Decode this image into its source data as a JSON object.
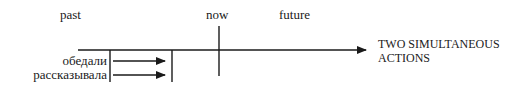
{
  "diagram": {
    "type": "timeline",
    "labels": {
      "past": "past",
      "now": "now",
      "future": "future"
    },
    "actions": [
      {
        "verb": "обедали"
      },
      {
        "verb": "рассказывала"
      }
    ],
    "caption_line1": "TWO SIMULTANEOUS",
    "caption_line2": "ACTIONS",
    "colors": {
      "line": "#1a1a1a",
      "background": "#ffffff"
    }
  }
}
